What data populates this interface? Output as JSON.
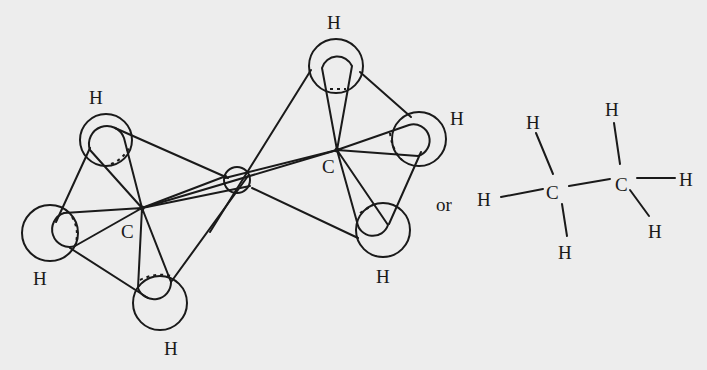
{
  "diagram": {
    "orbital_model": {
      "carbon_left": {
        "label": "C"
      },
      "carbon_right": {
        "label": "C"
      },
      "hydrogens_left": [
        {
          "label": "H"
        },
        {
          "label": "H"
        },
        {
          "label": "H"
        }
      ],
      "hydrogens_right": [
        {
          "label": "H"
        },
        {
          "label": "H"
        },
        {
          "label": "H"
        }
      ]
    },
    "connector": {
      "label": "or"
    },
    "structural_formula": {
      "carbons": [
        {
          "label": "C"
        },
        {
          "label": "C"
        }
      ],
      "hydrogens": [
        {
          "label": "H"
        },
        {
          "label": "H"
        },
        {
          "label": "H"
        },
        {
          "label": "H"
        },
        {
          "label": "H"
        },
        {
          "label": "H"
        }
      ]
    },
    "colors": {
      "background": "#ededed",
      "ink": "#1a1a1a"
    }
  }
}
